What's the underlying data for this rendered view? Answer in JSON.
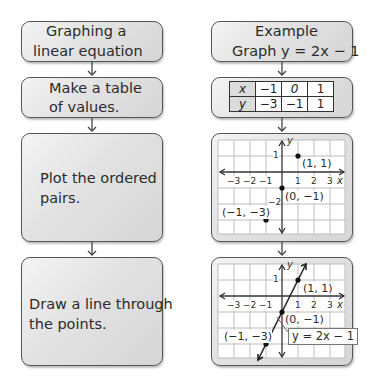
{
  "left_column": {
    "steps": [
      {
        "text_line1": "Graphing a",
        "text_line2": "linear equation"
      },
      {
        "text_line1": "Make a table",
        "text_line2": "of values."
      },
      {
        "text_line1": "Plot the ordered",
        "text_line2": "pairs."
      },
      {
        "text_line1": "Draw a line through",
        "text_line2": "the points."
      }
    ]
  },
  "right_column": {
    "title_line1": "Example",
    "title_line2": "Graph y = 2x − 1",
    "table": {
      "row_x": {
        "header": "x",
        "values": [
          "−1",
          "0",
          "1"
        ]
      },
      "row_y": {
        "header": "y",
        "values": [
          "−3",
          "−1",
          "1"
        ]
      }
    },
    "graph1": {
      "points": [
        {
          "label": "(1, 1)"
        },
        {
          "label": "(0, −1)"
        },
        {
          "label": "(−1, −3)"
        }
      ],
      "x_ticks": [
        "−3",
        "−2",
        "−1",
        "1",
        "2",
        "3"
      ],
      "y_ticks": [
        "1",
        "−2"
      ],
      "x_axis_label": "x",
      "y_axis_label": "y"
    },
    "graph2": {
      "points": [
        {
          "label": "(1, 1)"
        },
        {
          "label": "(0, −1)"
        },
        {
          "label": "(−1, −3)"
        }
      ],
      "x_ticks": [
        "−3",
        "−2",
        "−1",
        "1",
        "2",
        "3"
      ],
      "y_ticks": [
        "1"
      ],
      "x_axis_label": "x",
      "y_axis_label": "y",
      "line_label": "y = 2x − 1"
    }
  },
  "colors": {
    "box_border": "#555555",
    "grid_line": "#bdbdbd",
    "axis": "#333333",
    "point": "#111111"
  }
}
